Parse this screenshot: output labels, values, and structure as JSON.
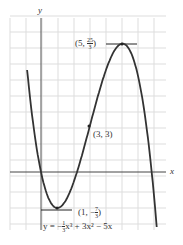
{
  "chart_data": {
    "type": "line",
    "title": "",
    "equation": "y = -1/3 x^3 + 3x^2 - 5x",
    "xlabel": "x",
    "ylabel": "y",
    "grid": true,
    "xlim": [
      -2,
      7.5
    ],
    "ylim": [
      -3.5,
      8.6
    ],
    "annotations": [
      {
        "label": "(5, 25/3)",
        "x": 5,
        "y": 8.333
      },
      {
        "label": "(3, 3)",
        "x": 3,
        "y": 3
      },
      {
        "label": "(1, -7/3)",
        "x": 1,
        "y": -2.333
      }
    ],
    "series": [
      {
        "name": "y = -1/3 x^3 + 3x^2 - 5x",
        "x": [
          -1,
          0,
          1,
          2,
          3,
          4,
          5,
          6,
          7
        ],
        "y": [
          8.333,
          0,
          -2.333,
          -0.667,
          3,
          6.667,
          8.333,
          6,
          -2.333
        ]
      }
    ]
  },
  "labels": {
    "x_axis": "x",
    "y_axis": "y",
    "max_point": "(5, ",
    "max_frac_num": "25",
    "max_frac_den": "3",
    "max_close": ")",
    "inflection_point": "(3, 3)",
    "min_point": "(1, −",
    "min_frac_num": "7",
    "min_frac_den": "3",
    "min_close": ")",
    "equation_prefix": "y = −",
    "equation_frac_num": "1",
    "equation_frac_den": "3",
    "equation_rest": "x³ + 3x² − 5x"
  }
}
